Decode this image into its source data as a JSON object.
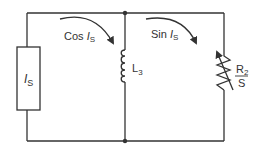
{
  "diagram": {
    "type": "circuit-schematic",
    "colors": {
      "wire": "#333333",
      "background": "#ffffff"
    },
    "components": {
      "source": {
        "symbol": "I",
        "subscript": "S"
      },
      "inductor": {
        "name": "L",
        "subscript": "3"
      },
      "resistor": {
        "numerator": "R",
        "numerator_sub": "2",
        "denominator": "S"
      }
    },
    "currents": {
      "left": {
        "func": "Cos",
        "var": "I",
        "sub": "S"
      },
      "right": {
        "func": "Sin",
        "var": "I",
        "sub": "S"
      }
    }
  }
}
